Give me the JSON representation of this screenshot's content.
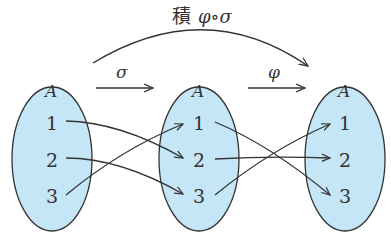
{
  "title": {
    "kanji": "積",
    "formula": "φ∘σ"
  },
  "maps": [
    {
      "name": "σ",
      "pairs": [
        [
          1,
          2
        ],
        [
          2,
          3
        ],
        [
          3,
          1
        ]
      ]
    },
    {
      "name": "φ",
      "pairs": [
        [
          1,
          3
        ],
        [
          2,
          2
        ],
        [
          3,
          1
        ]
      ]
    }
  ],
  "sets": [
    {
      "label": "A",
      "elements": [
        "1",
        "2",
        "3"
      ]
    },
    {
      "label": "A",
      "elements": [
        "1",
        "2",
        "3"
      ]
    },
    {
      "label": "A",
      "elements": [
        "1",
        "2",
        "3"
      ]
    }
  ],
  "colors": {
    "ellipse_fill": "#c4e6f6",
    "stroke": "#333333"
  }
}
